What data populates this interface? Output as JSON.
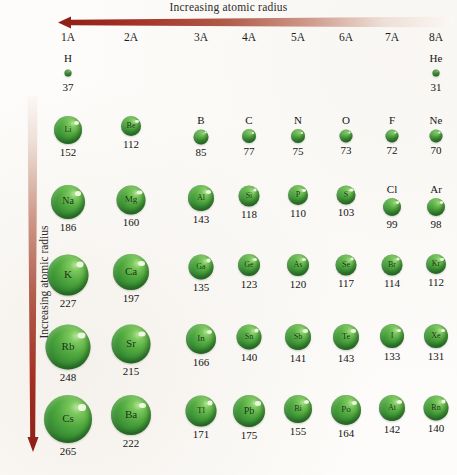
{
  "figure": {
    "title_horizontal": "Increasing atomic radius",
    "title_vertical": "Increasing atomic radius",
    "arrow_color_dark": "#9e2b20",
    "arrow_color_light": "#f7f3ef",
    "sphere_color": "#3f9a38",
    "background_color": "#fdfcfa"
  },
  "groups": [
    {
      "label": "1A",
      "x": 68
    },
    {
      "label": "2A",
      "x": 131
    },
    {
      "label": "3A",
      "x": 201
    },
    {
      "label": "4A",
      "x": 249
    },
    {
      "label": "5A",
      "x": 298
    },
    {
      "label": "6A",
      "x": 346
    },
    {
      "label": "7A",
      "x": 392
    },
    {
      "label": "8A",
      "x": 436
    }
  ],
  "chart_data": {
    "type": "bubble",
    "title": "Increasing atomic radius",
    "xlabel": "Increasing atomic radius",
    "ylabel": "Increasing atomic radius",
    "unit": "pm",
    "value_meaning": "atomic radius",
    "encoding": "sphere diameter proportional to atomic radius",
    "x_categories": [
      "1A",
      "2A",
      "3A",
      "4A",
      "5A",
      "6A",
      "7A",
      "8A"
    ],
    "y_categories": [
      "1",
      "2",
      "3",
      "4",
      "5",
      "6"
    ],
    "grid": false,
    "legend": "none",
    "elements": [
      {
        "symbol": "H",
        "value": 37,
        "group": "1A",
        "period": 1
      },
      {
        "symbol": "He",
        "value": 31,
        "group": "8A",
        "period": 1
      },
      {
        "symbol": "Li",
        "value": 152,
        "group": "1A",
        "period": 2
      },
      {
        "symbol": "Be",
        "value": 112,
        "group": "2A",
        "period": 2
      },
      {
        "symbol": "B",
        "value": 85,
        "group": "3A",
        "period": 2
      },
      {
        "symbol": "C",
        "value": 77,
        "group": "4A",
        "period": 2
      },
      {
        "symbol": "N",
        "value": 75,
        "group": "5A",
        "period": 2
      },
      {
        "symbol": "O",
        "value": 73,
        "group": "6A",
        "period": 2
      },
      {
        "symbol": "F",
        "value": 72,
        "group": "7A",
        "period": 2
      },
      {
        "symbol": "Ne",
        "value": 70,
        "group": "8A",
        "period": 2
      },
      {
        "symbol": "Na",
        "value": 186,
        "group": "1A",
        "period": 3
      },
      {
        "symbol": "Mg",
        "value": 160,
        "group": "2A",
        "period": 3
      },
      {
        "symbol": "Al",
        "value": 143,
        "group": "3A",
        "period": 3
      },
      {
        "symbol": "Si",
        "value": 118,
        "group": "4A",
        "period": 3
      },
      {
        "symbol": "P",
        "value": 110,
        "group": "5A",
        "period": 3
      },
      {
        "symbol": "S",
        "value": 103,
        "group": "6A",
        "period": 3
      },
      {
        "symbol": "Cl",
        "value": 99,
        "group": "7A",
        "period": 3
      },
      {
        "symbol": "Ar",
        "value": 98,
        "group": "8A",
        "period": 3
      },
      {
        "symbol": "K",
        "value": 227,
        "group": "1A",
        "period": 4
      },
      {
        "symbol": "Ca",
        "value": 197,
        "group": "2A",
        "period": 4
      },
      {
        "symbol": "Ga",
        "value": 135,
        "group": "3A",
        "period": 4
      },
      {
        "symbol": "Ge",
        "value": 123,
        "group": "4A",
        "period": 4
      },
      {
        "symbol": "As",
        "value": 120,
        "group": "5A",
        "period": 4
      },
      {
        "symbol": "Se",
        "value": 117,
        "group": "6A",
        "period": 4
      },
      {
        "symbol": "Br",
        "value": 114,
        "group": "7A",
        "period": 4
      },
      {
        "symbol": "Kr",
        "value": 112,
        "group": "8A",
        "period": 4
      },
      {
        "symbol": "Rb",
        "value": 248,
        "group": "1A",
        "period": 5
      },
      {
        "symbol": "Sr",
        "value": 215,
        "group": "2A",
        "period": 5
      },
      {
        "symbol": "In",
        "value": 166,
        "group": "3A",
        "period": 5
      },
      {
        "symbol": "Sn",
        "value": 140,
        "group": "4A",
        "period": 5
      },
      {
        "symbol": "Sb",
        "value": 141,
        "group": "5A",
        "period": 5
      },
      {
        "symbol": "Te",
        "value": 143,
        "group": "6A",
        "period": 5
      },
      {
        "symbol": "I",
        "value": 133,
        "group": "7A",
        "period": 5
      },
      {
        "symbol": "Xe",
        "value": 131,
        "group": "8A",
        "period": 5
      },
      {
        "symbol": "Cs",
        "value": 265,
        "group": "1A",
        "period": 6
      },
      {
        "symbol": "Ba",
        "value": 222,
        "group": "2A",
        "period": 6
      },
      {
        "symbol": "Tl",
        "value": 171,
        "group": "3A",
        "period": 6
      },
      {
        "symbol": "Pb",
        "value": 175,
        "group": "4A",
        "period": 6
      },
      {
        "symbol": "Bi",
        "value": 155,
        "group": "5A",
        "period": 6
      },
      {
        "symbol": "Po",
        "value": 164,
        "group": "6A",
        "period": 6
      },
      {
        "symbol": "At",
        "value": 142,
        "group": "7A",
        "period": 6
      },
      {
        "symbol": "Rn",
        "value": 140,
        "group": "8A",
        "period": 6
      }
    ]
  },
  "layout": {
    "row_tops": {
      "1": 52,
      "2": 114,
      "3": 183,
      "4": 252,
      "5": 322,
      "6": 393
    },
    "scale_px_per_pm": 0.182,
    "inside_label_min_diameter": 19
  }
}
